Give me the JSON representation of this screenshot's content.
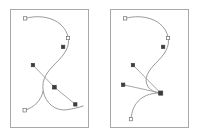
{
  "figure": {
    "title": "",
    "background_color": "#ffffff",
    "panel_count": 2,
    "panel_border_color": "#a8a8a8",
    "curve_color": "#8c8c8c",
    "polyline_color": "#9a9a9a",
    "node_open_fill": "#ffffff",
    "node_open_stroke": "#6e6e6e",
    "node_filled_fill": "#3c3c3c"
  },
  "chart_data": {
    "type": "line",
    "title": "",
    "xlabel": "",
    "ylabel": "",
    "grid": false,
    "legend": "none",
    "panels": [
      {
        "name": "left-panel",
        "viewbox": [
          0,
          0,
          79,
          119
        ],
        "curves": [
          {
            "name": "s-curve",
            "path": "M 14.5 8.5 C 34 3.5 54 10 58.5 27 C 61 38 54 46 46 54 C 38 62 31 70 33 82 C 35 95 46 103 57 101.5 C 64 100.5 70 99 74.5 97.5"
          },
          {
            "name": "lower-tail",
            "path": "M 33 82 C 31 92 24 99 14 102"
          }
        ],
        "polylines": [
          {
            "name": "control-polygon-diagonal",
            "path": "M 22.5 56 L 44.5 78.5 L 66 96"
          }
        ],
        "nodes": [
          {
            "name": "node-top-left",
            "x": 14.5,
            "y": 8.5,
            "style": "open",
            "size": 3.4
          },
          {
            "name": "node-upper-right",
            "x": 58.5,
            "y": 28.5,
            "style": "open",
            "size": 3.4
          },
          {
            "name": "node-mid-right",
            "x": 53.5,
            "y": 37.5,
            "style": "filled",
            "size": 3.4
          },
          {
            "name": "node-mid-left",
            "x": 22.5,
            "y": 56.0,
            "style": "filled",
            "size": 3.4
          },
          {
            "name": "node-center",
            "x": 44.5,
            "y": 78.5,
            "style": "filled",
            "size": 3.8
          },
          {
            "name": "node-bottom-right",
            "x": 66.0,
            "y": 96.0,
            "style": "filled",
            "size": 3.4
          },
          {
            "name": "node-bottom-left",
            "x": 14.0,
            "y": 102.0,
            "style": "open",
            "size": 3.4
          }
        ]
      },
      {
        "name": "right-panel",
        "viewbox": [
          0,
          0,
          79,
          119
        ],
        "curves": [
          {
            "name": "s-curve",
            "path": "M 14.5 8.5 C 34 3.5 54 10 58.5 27 C 61 38 54 46 46 54 C 38 62 33 70 38 78 C 41 82.5 46 84 51 84.5"
          },
          {
            "name": "lower-hook",
            "path": "M 51 84.5 C 40 84 31 88 26 95 C 22 100.5 21 106 20.5 111"
          }
        ],
        "polylines": [
          {
            "name": "spoke-upper",
            "path": "M 22.5 56 L 51 84.5"
          },
          {
            "name": "spoke-lower",
            "path": "M 12.5 76 L 51 84.5"
          }
        ],
        "nodes": [
          {
            "name": "node-top-left",
            "x": 14.5,
            "y": 8.5,
            "style": "open",
            "size": 3.4
          },
          {
            "name": "node-upper-right",
            "x": 58.5,
            "y": 28.5,
            "style": "open",
            "size": 3.4
          },
          {
            "name": "node-mid-right",
            "x": 53.5,
            "y": 37.5,
            "style": "filled",
            "size": 3.4
          },
          {
            "name": "node-mid-left",
            "x": 22.5,
            "y": 56.0,
            "style": "filled",
            "size": 3.4
          },
          {
            "name": "node-left-lower",
            "x": 12.5,
            "y": 76.0,
            "style": "filled",
            "size": 3.4
          },
          {
            "name": "node-junction",
            "x": 51.0,
            "y": 84.5,
            "style": "filled",
            "size": 4.2
          },
          {
            "name": "node-bottom-stem",
            "x": 20.5,
            "y": 111.0,
            "style": "open",
            "size": 3.4
          }
        ]
      }
    ]
  }
}
